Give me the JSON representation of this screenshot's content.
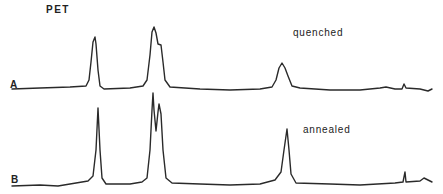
{
  "chart_data": {
    "type": "line",
    "title": "PET",
    "xlabel": "",
    "ylabel": "",
    "grid": false,
    "axes_visible": false,
    "series": [
      {
        "name": "A",
        "annotation": "quenched",
        "points_px": [
          [
            12,
            89
          ],
          [
            40,
            88
          ],
          [
            70,
            87
          ],
          [
            86,
            86
          ],
          [
            89,
            80
          ],
          [
            91,
            62
          ],
          [
            93,
            42
          ],
          [
            95,
            37
          ],
          [
            96,
            44
          ],
          [
            98,
            70
          ],
          [
            100,
            86
          ],
          [
            104,
            89
          ],
          [
            130,
            88
          ],
          [
            143,
            86
          ],
          [
            147,
            80
          ],
          [
            150,
            55
          ],
          [
            152,
            32
          ],
          [
            154,
            27
          ],
          [
            156,
            33
          ],
          [
            158,
            44
          ],
          [
            161,
            45
          ],
          [
            163,
            62
          ],
          [
            165,
            80
          ],
          [
            170,
            87
          ],
          [
            200,
            89
          ],
          [
            230,
            90
          ],
          [
            260,
            89
          ],
          [
            272,
            87
          ],
          [
            276,
            80
          ],
          [
            279,
            68
          ],
          [
            282,
            63
          ],
          [
            285,
            68
          ],
          [
            288,
            76
          ],
          [
            292,
            86
          ],
          [
            300,
            88
          ],
          [
            330,
            90
          ],
          [
            360,
            90
          ],
          [
            380,
            88
          ],
          [
            386,
            87
          ],
          [
            395,
            89
          ],
          [
            402,
            89
          ],
          [
            404,
            84
          ],
          [
            406,
            88
          ],
          [
            420,
            89
          ],
          [
            428,
            91
          ],
          [
            432,
            89
          ]
        ],
        "peaks": [
          {
            "x_px": 95,
            "label": "peak 1",
            "relative_height": 0.88
          },
          {
            "x_px": 154,
            "label": "peak 2",
            "relative_height": 1.0
          },
          {
            "x_px": 161,
            "label": "peak 2 shoulder",
            "relative_height": 0.72
          },
          {
            "x_px": 282,
            "label": "peak 3",
            "relative_height": 0.42
          }
        ]
      },
      {
        "name": "B",
        "annotation": "annealed",
        "points_px": [
          [
            12,
            186
          ],
          [
            40,
            185
          ],
          [
            58,
            186
          ],
          [
            70,
            184
          ],
          [
            88,
            181
          ],
          [
            93,
            176
          ],
          [
            96,
            150
          ],
          [
            98,
            108
          ],
          [
            100,
            150
          ],
          [
            102,
            178
          ],
          [
            106,
            184
          ],
          [
            130,
            184
          ],
          [
            142,
            182
          ],
          [
            147,
            178
          ],
          [
            150,
            150
          ],
          [
            152,
            110
          ],
          [
            153,
            93
          ],
          [
            154,
            110
          ],
          [
            156,
            131
          ],
          [
            158,
            112
          ],
          [
            159,
            104
          ],
          [
            161,
            114
          ],
          [
            163,
            150
          ],
          [
            166,
            178
          ],
          [
            172,
            183
          ],
          [
            200,
            184
          ],
          [
            230,
            185
          ],
          [
            260,
            184
          ],
          [
            275,
            180
          ],
          [
            281,
            172
          ],
          [
            284,
            150
          ],
          [
            287,
            129
          ],
          [
            289,
            150
          ],
          [
            291,
            174
          ],
          [
            296,
            183
          ],
          [
            330,
            184
          ],
          [
            360,
            185
          ],
          [
            395,
            183
          ],
          [
            403,
            182
          ],
          [
            405,
            172
          ],
          [
            406,
            182
          ],
          [
            420,
            181
          ],
          [
            424,
            178
          ],
          [
            428,
            180
          ],
          [
            432,
            182
          ]
        ],
        "peaks": [
          {
            "x_px": 98,
            "label": "peak 1",
            "relative_height": 0.84
          },
          {
            "x_px": 153,
            "label": "peak 2a",
            "relative_height": 1.0
          },
          {
            "x_px": 159,
            "label": "peak 2b",
            "relative_height": 0.87
          },
          {
            "x_px": 287,
            "label": "peak 3",
            "relative_height": 0.59
          }
        ]
      }
    ],
    "annotations": [
      "PET",
      "quenched",
      "annealed",
      "A",
      "B"
    ]
  },
  "labels": {
    "title": "PET",
    "trace_a": "A",
    "trace_b": "B",
    "quenched": "quenched",
    "annealed": "annealed"
  }
}
